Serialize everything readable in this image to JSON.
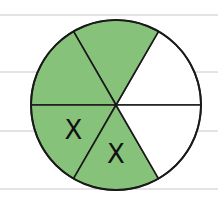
{
  "diagram": {
    "total_parts": 6,
    "shaded_parts": 4,
    "crossed_parts": 2,
    "colors": {
      "shaded": "#86c27a",
      "unshaded": "#ffffff",
      "outline": "#1a1a1a",
      "ruled_line": "#c8c8c8"
    },
    "sectors": [
      {
        "position": "upper-right",
        "shaded": false,
        "mark": ""
      },
      {
        "position": "upper-top",
        "shaded": true,
        "mark": ""
      },
      {
        "position": "upper-left",
        "shaded": true,
        "mark": ""
      },
      {
        "position": "lower-left",
        "shaded": true,
        "mark": "X"
      },
      {
        "position": "lower-bottom",
        "shaded": true,
        "mark": "X"
      },
      {
        "position": "lower-right",
        "shaded": false,
        "mark": ""
      }
    ],
    "ruled_line_count": 4
  }
}
